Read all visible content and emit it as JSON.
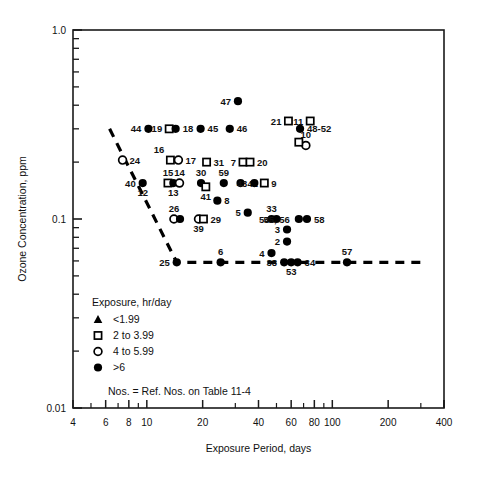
{
  "chart_data": {
    "type": "scatter",
    "title": "",
    "xlabel": "Exposure Period, days",
    "ylabel": "Ozone Concentration, ppm",
    "xscale": "log",
    "yscale": "log",
    "xlim": [
      4,
      400
    ],
    "ylim": [
      0.01,
      1.0
    ],
    "grid": false,
    "x_tick_labels": [
      "4",
      "6",
      "8",
      "10",
      "20",
      "40",
      "60",
      "80",
      "100",
      "200",
      "400"
    ],
    "x_tick_values": [
      4,
      6,
      8,
      10,
      20,
      40,
      60,
      80,
      100,
      200,
      400
    ],
    "y_tick_labels": [
      "1.0",
      "0.1",
      "0.01"
    ],
    "y_tick_values": [
      1.0,
      0.1,
      0.01
    ],
    "legend": {
      "title": "Exposure, hr/day",
      "position": "inside-lower-left",
      "entries": [
        {
          "marker": "filled-triangle",
          "label": "<1.99"
        },
        {
          "marker": "open-square",
          "label": "2 to 3.99"
        },
        {
          "marker": "open-circle",
          "label": "4 to 5.99"
        },
        {
          "marker": "filled-circle",
          "label": ">6"
        }
      ]
    },
    "note": "Nos. = Ref. Nos. on Table 11-4",
    "annotation_line": {
      "style": "dashed",
      "description": "threshold envelope",
      "points": [
        [
          6.3,
          0.3
        ],
        [
          14.5,
          0.059
        ],
        [
          320,
          0.059
        ]
      ]
    },
    "points": [
      {
        "ref": "47",
        "marker": "filled-circle",
        "x": 31,
        "y": 0.42,
        "label_side": "left"
      },
      {
        "ref": "21",
        "marker": "open-square",
        "x": 58,
        "y": 0.33,
        "label_side": "left"
      },
      {
        "ref": "11",
        "marker": "open-square",
        "x": 76,
        "y": 0.33,
        "label_side": "left"
      },
      {
        "ref": "44",
        "marker": "filled-circle",
        "x": 10.2,
        "y": 0.3,
        "label_side": "left"
      },
      {
        "ref": "19",
        "marker": "open-square",
        "x": 13.2,
        "y": 0.3,
        "label_side": "left"
      },
      {
        "ref": "18",
        "marker": "filled-circle",
        "x": 14.3,
        "y": 0.3,
        "label_side": "right"
      },
      {
        "ref": "45",
        "marker": "filled-circle",
        "x": 19.5,
        "y": 0.3,
        "label_side": "right"
      },
      {
        "ref": "46",
        "marker": "filled-circle",
        "x": 28,
        "y": 0.3,
        "label_side": "right"
      },
      {
        "ref": "48-52",
        "marker": "filled-circle",
        "x": 67,
        "y": 0.3,
        "label_side": "right"
      },
      {
        "ref": "10",
        "marker": "open-circle",
        "x": 72,
        "y": 0.245,
        "label_side": "above"
      },
      {
        "ref": "",
        "marker": "open-square",
        "x": 66,
        "y": 0.255,
        "label_side": "none"
      },
      {
        "ref": "24",
        "marker": "open-circle",
        "x": 7.4,
        "y": 0.205,
        "label_side": "right"
      },
      {
        "ref": "16",
        "marker": "open-square",
        "x": 13.4,
        "y": 0.205,
        "label_side": "above-left"
      },
      {
        "ref": "17",
        "marker": "open-circle",
        "x": 14.8,
        "y": 0.205,
        "label_side": "right"
      },
      {
        "ref": "31",
        "marker": "open-square",
        "x": 21,
        "y": 0.2,
        "label_side": "right"
      },
      {
        "ref": "7",
        "marker": "open-square",
        "x": 33,
        "y": 0.2,
        "label_side": "left"
      },
      {
        "ref": "20",
        "marker": "open-square",
        "x": 36,
        "y": 0.2,
        "label_side": "right"
      },
      {
        "ref": "40",
        "marker": "filled-circle",
        "x": 9.5,
        "y": 0.155,
        "label_side": "left"
      },
      {
        "ref": "12",
        "marker": "none",
        "x": 9.5,
        "y": 0.155,
        "label_side": "below"
      },
      {
        "ref": "15",
        "marker": "open-square",
        "x": 13.0,
        "y": 0.155,
        "label_side": "above"
      },
      {
        "ref": "13",
        "marker": "filled-circle",
        "x": 13.9,
        "y": 0.155,
        "label_side": "below"
      },
      {
        "ref": "14",
        "marker": "open-circle",
        "x": 15.0,
        "y": 0.155,
        "label_side": "above"
      },
      {
        "ref": "30",
        "marker": "filled-circle",
        "x": 19.6,
        "y": 0.155,
        "label_side": "above"
      },
      {
        "ref": "41",
        "marker": "open-square",
        "x": 20.8,
        "y": 0.148,
        "label_side": "below"
      },
      {
        "ref": "59",
        "marker": "filled-circle",
        "x": 26,
        "y": 0.155,
        "label_side": "above"
      },
      {
        "ref": "42",
        "marker": "filled-circle",
        "x": 32,
        "y": 0.155,
        "label_side": "right"
      },
      {
        "ref": "43",
        "marker": "filled-circle",
        "x": 38,
        "y": 0.155,
        "label_side": "left"
      },
      {
        "ref": "9",
        "marker": "open-square",
        "x": 43,
        "y": 0.155,
        "label_side": "right"
      },
      {
        "ref": "8",
        "marker": "filled-circle",
        "x": 24,
        "y": 0.125,
        "label_side": "right"
      },
      {
        "ref": "26",
        "marker": "open-circle",
        "x": 14.0,
        "y": 0.1,
        "label_side": "above"
      },
      {
        "ref": "",
        "marker": "filled-circle",
        "x": 15.1,
        "y": 0.1,
        "label_side": "none"
      },
      {
        "ref": "39",
        "marker": "open-circle",
        "x": 19.0,
        "y": 0.1,
        "label_side": "below"
      },
      {
        "ref": "29",
        "marker": "open-square",
        "x": 20.2,
        "y": 0.1,
        "label_side": "right"
      },
      {
        "ref": "5",
        "marker": "filled-circle",
        "x": 35,
        "y": 0.108,
        "label_side": "left"
      },
      {
        "ref": "33",
        "marker": "filled-circle",
        "x": 47,
        "y": 0.1,
        "label_side": "above"
      },
      {
        "ref": "54",
        "marker": "filled-circle",
        "x": 50,
        "y": 0.1,
        "label_side": "left"
      },
      {
        "ref": "55, 56",
        "marker": "filled-circle",
        "x": 66,
        "y": 0.1,
        "label_side": "right-pair"
      },
      {
        "ref": "58",
        "marker": "filled-circle",
        "x": 73,
        "y": 0.1,
        "label_side": "right"
      },
      {
        "ref": "3",
        "marker": "filled-circle",
        "x": 57,
        "y": 0.088,
        "label_side": "left"
      },
      {
        "ref": "2",
        "marker": "filled-circle",
        "x": 57,
        "y": 0.076,
        "label_side": "left"
      },
      {
        "ref": "4",
        "marker": "filled-circle",
        "x": 47,
        "y": 0.066,
        "label_side": "left"
      },
      {
        "ref": "25",
        "marker": "filled-circle",
        "x": 14.5,
        "y": 0.059,
        "label_side": "left"
      },
      {
        "ref": "6",
        "marker": "filled-circle",
        "x": 25,
        "y": 0.059,
        "label_side": "above"
      },
      {
        "ref": "38",
        "marker": "filled-circle",
        "x": 55,
        "y": 0.059,
        "label_side": "left"
      },
      {
        "ref": "53",
        "marker": "filled-circle",
        "x": 60,
        "y": 0.059,
        "label_side": "below"
      },
      {
        "ref": "34",
        "marker": "filled-circle",
        "x": 65,
        "y": 0.059,
        "label_side": "right"
      },
      {
        "ref": "57",
        "marker": "filled-circle",
        "x": 120,
        "y": 0.059,
        "label_side": "above"
      }
    ]
  },
  "colors": {
    "axis": "#1a1a1a",
    "marker": "#000000",
    "background": "#ffffff"
  }
}
